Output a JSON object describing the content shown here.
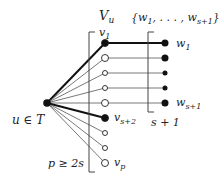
{
  "labels": {
    "hub": "u ∈ T",
    "set_v": "V",
    "set_v_sub": "u",
    "set_w": "{w",
    "set_w_mid": "1",
    "set_w_dots": ", . . . , w",
    "set_w_sub": "s+1",
    "set_w_close": "}",
    "v1": "v",
    "v1_sub": "1",
    "vs2": "v",
    "vs2_sub": "s+2",
    "vp": "v",
    "vp_sub": "p",
    "w1": "w",
    "w1_sub": "1",
    "ws1": "w",
    "ws1_sub": "s+1",
    "count_w": "s + 1",
    "count_v": "p ≥ 2s"
  },
  "nodes": {
    "hub": {
      "x": 47,
      "y": 103,
      "fill": "#111111"
    },
    "v": [
      {
        "y": 43,
        "filled": true,
        "r": 3.5,
        "thick": true
      },
      {
        "y": 58,
        "filled": false,
        "r": 3.5,
        "thick": false
      },
      {
        "y": 73,
        "filled": false,
        "r": 2.5,
        "thick": false
      },
      {
        "y": 88,
        "filled": false,
        "r": 2.5,
        "thick": false
      },
      {
        "y": 103,
        "filled": false,
        "r": 3.5,
        "thick": false
      },
      {
        "y": 118,
        "filled": true,
        "r": 3.5,
        "thick": true
      },
      {
        "y": 133,
        "filled": false,
        "r": 2.5,
        "thick": false
      },
      {
        "y": 148,
        "filled": false,
        "r": 2.5,
        "thick": false
      },
      {
        "y": 163,
        "filled": false,
        "r": 3.5,
        "thick": false
      }
    ],
    "w": [
      {
        "y": 43,
        "r": 3.5,
        "thick": true
      },
      {
        "y": 58,
        "r": 3.5,
        "thick": false
      },
      {
        "y": 73,
        "r": 2.5,
        "thick": false
      },
      {
        "y": 88,
        "r": 2.5,
        "thick": false
      },
      {
        "y": 103,
        "r": 3.5,
        "thick": false
      }
    ]
  },
  "colors": {
    "ink": "#111111",
    "line": "#333333",
    "bg": "#ffffff"
  }
}
